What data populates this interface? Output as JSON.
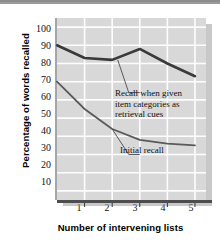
{
  "chart_data": {
    "type": "line",
    "title": "",
    "xlabel": "Number of intervening lists",
    "ylabel": "Percentage of words recalled",
    "x": [
      0,
      1,
      2,
      3,
      4,
      5
    ],
    "xtick_labels": [
      "1",
      "2",
      "3",
      "4",
      "5"
    ],
    "xtick_values": [
      1,
      2,
      3,
      4,
      5
    ],
    "ytick_labels": [
      "100",
      "90",
      "80",
      "70",
      "60",
      "50",
      "40",
      "30",
      "20",
      "10"
    ],
    "ytick_values": [
      100,
      90,
      80,
      70,
      60,
      50,
      40,
      30,
      20,
      10
    ],
    "xlim": [
      0,
      5.4
    ],
    "ylim": [
      5,
      105
    ],
    "grid": true,
    "legend": "annotations",
    "series": [
      {
        "name": "Recall when given item categories as retrieval cues",
        "values": [
          90,
          83,
          82,
          88,
          80,
          73
        ],
        "color": "#3a3a3a",
        "line_width": 2.6
      },
      {
        "name": "Initial recall",
        "values": [
          70,
          55,
          44,
          38,
          36,
          35
        ],
        "color": "#5a5a5a",
        "line_width": 1.8
      }
    ],
    "annotations": [
      {
        "id": "annotation-cued-recall",
        "text": "Recall when given\nitem categories as\nretrieval cues",
        "leader_from": [
          2.2,
          82
        ],
        "leader_to": [
          2.6,
          64
        ]
      },
      {
        "id": "annotation-initial-recall",
        "text": "Initial recall",
        "leader_from": [
          2.0,
          44
        ],
        "leader_to": [
          2.6,
          30
        ]
      }
    ],
    "colors": {
      "plot_background": "#d8d8d8",
      "gridline": "#fdfdfd",
      "axis": "#4d4d4d",
      "shadow": "#9b9b9b",
      "text": "#111111",
      "page_background": "#ffffff",
      "topbar": "#9a9a9a"
    }
  }
}
